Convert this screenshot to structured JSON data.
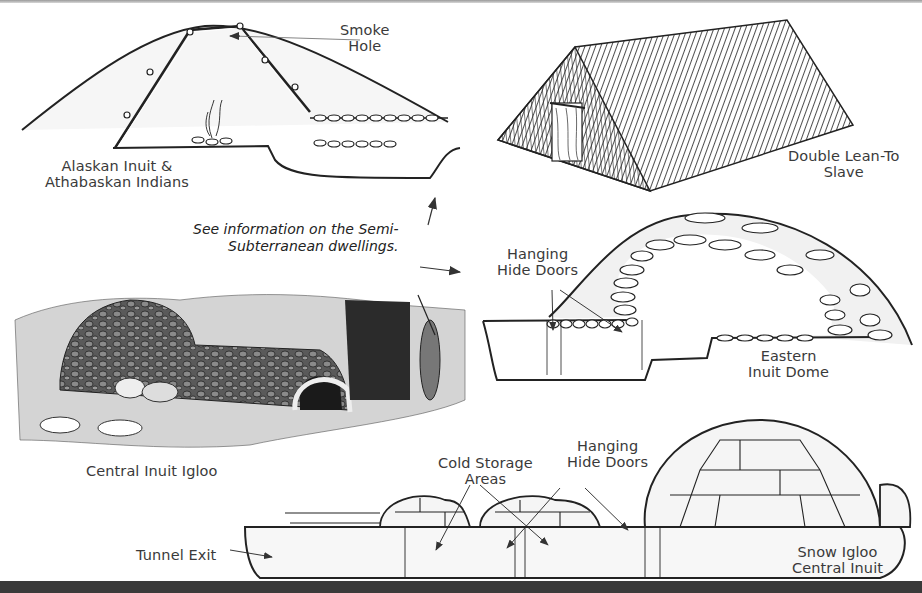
{
  "figure": {
    "colors": {
      "line": "#222222",
      "label": "#3a3a3a",
      "bottom_bar": "#3a3a3a",
      "shading": "#e6e6e6"
    }
  },
  "panels": {
    "semi_subterranean": {
      "label_line1": "Alaskan Inuit &",
      "label_line2": "Athabaskan Indians",
      "callout_line1": "Smoke",
      "callout_line2": "Hole"
    },
    "lean_to": {
      "label_line1": "Double Lean-To",
      "label_line2": "Slave"
    },
    "note": {
      "line1": "See information on the Semi-",
      "line2": "Subterranean dwellings."
    },
    "eastern_dome": {
      "callout_line1": "Hanging",
      "callout_line2": "Hide Doors",
      "label_line1": "Eastern",
      "label_line2": "Inuit Dome"
    },
    "central_igloo_engraving": {
      "label": "Central Inuit Igloo"
    },
    "snow_igloo": {
      "cold_storage_line1": "Cold Storage",
      "cold_storage_line2": "Areas",
      "doors_line1": "Hanging",
      "doors_line2": "Hide Doors",
      "tunnel_label": "Tunnel Exit",
      "label_line1": "Snow Igloo",
      "label_line2": "Central Inuit"
    }
  }
}
